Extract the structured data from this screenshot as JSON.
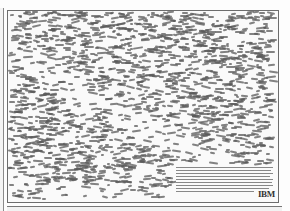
{
  "document": {
    "type": "print advertisement poster",
    "brand": "IBM",
    "body_copy_legible": false,
    "body_copy_description": "Dense field of tiny scattered word fragments forming a textured pattern with a lighter diagonal band; small paragraph of body text lower right",
    "logo_text": "IBM"
  },
  "colors": {
    "paper": "#fafafa",
    "ink": "#5a5a5a",
    "frame": "#6d6d6d"
  }
}
